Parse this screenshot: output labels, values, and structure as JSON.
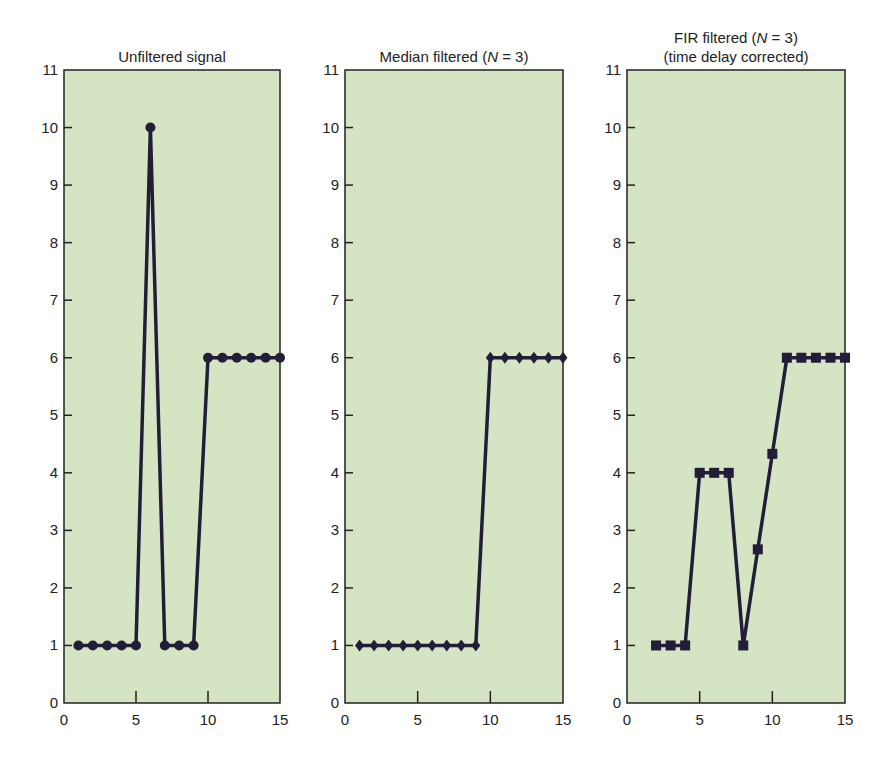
{
  "chart_data": [
    {
      "type": "line",
      "title": "Unfiltered signal",
      "marker": "circle",
      "x": [
        1,
        2,
        3,
        4,
        5,
        6,
        7,
        8,
        9,
        10,
        11,
        12,
        13,
        14,
        15
      ],
      "values": [
        1,
        1,
        1,
        1,
        1,
        10,
        1,
        1,
        1,
        6,
        6,
        6,
        6,
        6,
        6
      ],
      "xlim": [
        0,
        15
      ],
      "ylim": [
        0,
        11
      ],
      "xticks": [
        0,
        5,
        10,
        15
      ],
      "yticks": [
        0,
        1,
        2,
        3,
        4,
        5,
        6,
        7,
        8,
        9,
        10,
        11
      ],
      "xlabel": "",
      "ylabel": "",
      "grid": false
    },
    {
      "type": "line",
      "title": "Median filtered (N = 3)",
      "marker": "diamond",
      "x": [
        1,
        2,
        3,
        4,
        5,
        6,
        7,
        8,
        9,
        10,
        11,
        12,
        13,
        14,
        15
      ],
      "values": [
        1,
        1,
        1,
        1,
        1,
        1,
        1,
        1,
        1,
        6,
        6,
        6,
        6,
        6,
        6
      ],
      "xlim": [
        0,
        15
      ],
      "ylim": [
        0,
        11
      ],
      "xticks": [
        0,
        5,
        10,
        15
      ],
      "yticks": [
        0,
        1,
        2,
        3,
        4,
        5,
        6,
        7,
        8,
        9,
        10,
        11
      ],
      "xlabel": "",
      "ylabel": "",
      "grid": false
    },
    {
      "type": "line",
      "title": "FIR filtered (N = 3) (time delay corrected)",
      "marker": "square",
      "x": [
        2,
        3,
        4,
        5,
        6,
        7,
        8,
        9,
        10,
        11,
        12,
        13,
        14,
        15
      ],
      "values": [
        1,
        1,
        1,
        4,
        4,
        4,
        1,
        2.67,
        4.33,
        6,
        6,
        6,
        6,
        6
      ],
      "xlim": [
        0,
        15
      ],
      "ylim": [
        0,
        11
      ],
      "xticks": [
        0,
        5,
        10,
        15
      ],
      "yticks": [
        0,
        1,
        2,
        3,
        4,
        5,
        6,
        7,
        8,
        9,
        10,
        11
      ],
      "xlabel": "",
      "ylabel": "",
      "grid": false
    }
  ],
  "panels": [
    {
      "title_lines": [
        "Unfiltered signal"
      ]
    },
    {
      "title_lines": [
        "Median filtered (N = 3)"
      ]
    },
    {
      "title_lines": [
        "FIR filtered (N = 3)",
        "(time delay corrected)"
      ]
    }
  ],
  "colors": {
    "plot_bg": "#d5e4c3",
    "line": "#231d3a",
    "axis": "#222222"
  }
}
